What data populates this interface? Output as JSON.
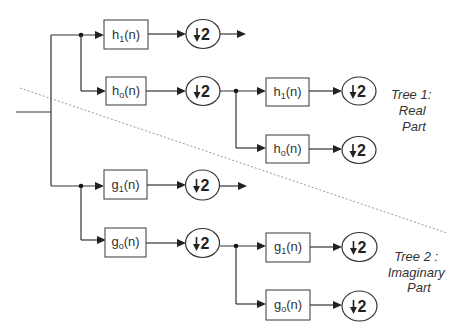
{
  "diagram": {
    "blocks": {
      "t1_l1_high": {
        "base": "h",
        "sub": "1",
        "arg": "(n)"
      },
      "t1_l1_low": {
        "base": "h",
        "sub": "o",
        "arg": "(n)"
      },
      "t1_l2_high": {
        "base": "h",
        "sub": "1",
        "arg": "(n)"
      },
      "t1_l2_low": {
        "base": "h",
        "sub": "o",
        "arg": "(n)"
      },
      "t2_l1_high": {
        "base": "g",
        "sub": "1",
        "arg": "(n)"
      },
      "t2_l1_low": {
        "base": "g",
        "sub": "o",
        "arg": "(n)"
      },
      "t2_l2_high": {
        "base": "g",
        "sub": "1",
        "arg": "(n)"
      },
      "t2_l2_low": {
        "base": "g",
        "sub": "o",
        "arg": "(n)"
      }
    },
    "downsample": {
      "symbol": "down-arrow",
      "factor": "2"
    },
    "labels": {
      "tree1": [
        "Tree 1:",
        "Real",
        "Part"
      ],
      "tree2": [
        "Tree 2 :",
        "Imaginary",
        "Part"
      ]
    },
    "colors": {
      "line": "#333333",
      "divider": "#9a9a9a",
      "background": "#ffffff"
    }
  }
}
